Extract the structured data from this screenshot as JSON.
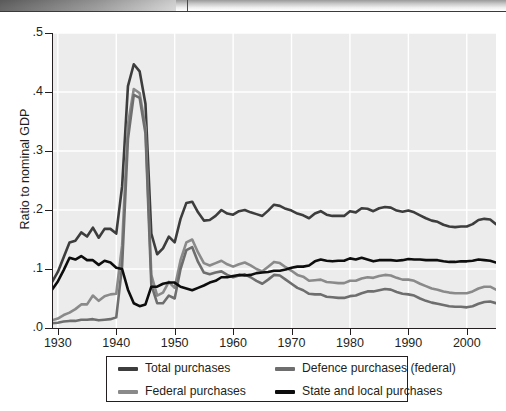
{
  "chart_data": {
    "type": "line",
    "title": "",
    "xlabel": "",
    "ylabel": "Ratio to nominal GDP",
    "xlim": [
      1929,
      2005
    ],
    "ylim": [
      0.0,
      0.5
    ],
    "grid": true,
    "legend_position": "bottom",
    "ytick_labels": [
      ".0",
      ".1",
      ".2",
      ".3",
      ".4",
      ".5"
    ],
    "ytick_values": [
      0.0,
      0.1,
      0.2,
      0.3,
      0.4,
      0.5
    ],
    "xtick_labels": [
      "1930",
      "1940",
      "1950",
      "1960",
      "1970",
      "1980",
      "1990",
      "2000"
    ],
    "xtick_values": [
      1930,
      1940,
      1950,
      1960,
      1970,
      1980,
      1990,
      2000
    ],
    "x": [
      1929,
      1930,
      1931,
      1932,
      1933,
      1934,
      1935,
      1936,
      1937,
      1938,
      1939,
      1940,
      1941,
      1942,
      1943,
      1944,
      1945,
      1946,
      1947,
      1948,
      1949,
      1950,
      1951,
      1952,
      1953,
      1954,
      1955,
      1956,
      1957,
      1958,
      1959,
      1960,
      1961,
      1962,
      1963,
      1964,
      1965,
      1966,
      1967,
      1968,
      1969,
      1970,
      1971,
      1972,
      1973,
      1974,
      1975,
      1976,
      1977,
      1978,
      1979,
      1980,
      1981,
      1982,
      1983,
      1984,
      1985,
      1986,
      1987,
      1988,
      1989,
      1990,
      1991,
      1992,
      1993,
      1994,
      1995,
      1996,
      1997,
      1998,
      1999,
      2000,
      2001,
      2002,
      2003,
      2004,
      2005
    ],
    "series": [
      {
        "name": "Total purchases",
        "color": "#3d3d3d",
        "values": [
          0.078,
          0.095,
          0.12,
          0.145,
          0.148,
          0.162,
          0.155,
          0.17,
          0.153,
          0.168,
          0.168,
          0.16,
          0.24,
          0.41,
          0.447,
          0.435,
          0.38,
          0.16,
          0.125,
          0.135,
          0.155,
          0.145,
          0.185,
          0.212,
          0.214,
          0.196,
          0.182,
          0.183,
          0.19,
          0.2,
          0.194,
          0.192,
          0.198,
          0.2,
          0.196,
          0.193,
          0.19,
          0.199,
          0.209,
          0.207,
          0.202,
          0.199,
          0.194,
          0.191,
          0.186,
          0.194,
          0.198,
          0.192,
          0.19,
          0.19,
          0.19,
          0.198,
          0.196,
          0.203,
          0.202,
          0.198,
          0.203,
          0.205,
          0.204,
          0.199,
          0.197,
          0.199,
          0.196,
          0.191,
          0.186,
          0.182,
          0.18,
          0.175,
          0.172,
          0.171,
          0.172,
          0.172,
          0.176,
          0.183,
          0.185,
          0.184,
          0.176
        ]
      },
      {
        "name": "Federal purchases",
        "color": "#8a8a8a",
        "values": [
          0.013,
          0.016,
          0.022,
          0.026,
          0.032,
          0.04,
          0.04,
          0.055,
          0.046,
          0.054,
          0.057,
          0.058,
          0.14,
          0.345,
          0.405,
          0.398,
          0.34,
          0.09,
          0.055,
          0.06,
          0.078,
          0.068,
          0.115,
          0.145,
          0.15,
          0.128,
          0.11,
          0.106,
          0.11,
          0.114,
          0.108,
          0.104,
          0.108,
          0.111,
          0.106,
          0.1,
          0.096,
          0.104,
          0.112,
          0.11,
          0.103,
          0.097,
          0.09,
          0.087,
          0.08,
          0.081,
          0.082,
          0.078,
          0.077,
          0.076,
          0.076,
          0.08,
          0.08,
          0.084,
          0.086,
          0.085,
          0.088,
          0.09,
          0.089,
          0.085,
          0.082,
          0.082,
          0.08,
          0.075,
          0.071,
          0.067,
          0.065,
          0.062,
          0.06,
          0.059,
          0.059,
          0.059,
          0.062,
          0.067,
          0.07,
          0.07,
          0.065
        ]
      },
      {
        "name": "Defence purchases (federal)",
        "color": "#6e6e6e",
        "values": [
          0.008,
          0.009,
          0.011,
          0.012,
          0.012,
          0.014,
          0.014,
          0.015,
          0.013,
          0.014,
          0.015,
          0.018,
          0.105,
          0.32,
          0.395,
          0.39,
          0.33,
          0.073,
          0.042,
          0.042,
          0.055,
          0.05,
          0.1,
          0.132,
          0.137,
          0.112,
          0.094,
          0.091,
          0.094,
          0.096,
          0.09,
          0.086,
          0.089,
          0.091,
          0.086,
          0.08,
          0.075,
          0.082,
          0.09,
          0.089,
          0.082,
          0.075,
          0.068,
          0.064,
          0.058,
          0.057,
          0.057,
          0.053,
          0.052,
          0.051,
          0.051,
          0.054,
          0.055,
          0.059,
          0.062,
          0.062,
          0.064,
          0.066,
          0.065,
          0.061,
          0.058,
          0.057,
          0.055,
          0.05,
          0.046,
          0.043,
          0.041,
          0.039,
          0.037,
          0.036,
          0.036,
          0.035,
          0.037,
          0.041,
          0.044,
          0.045,
          0.042
        ]
      },
      {
        "name": "State and local purchases",
        "color": "#0d0d0d",
        "values": [
          0.065,
          0.079,
          0.098,
          0.119,
          0.116,
          0.122,
          0.115,
          0.115,
          0.107,
          0.114,
          0.111,
          0.102,
          0.1,
          0.065,
          0.042,
          0.037,
          0.04,
          0.07,
          0.07,
          0.075,
          0.077,
          0.077,
          0.07,
          0.067,
          0.064,
          0.068,
          0.072,
          0.077,
          0.08,
          0.086,
          0.086,
          0.088,
          0.09,
          0.089,
          0.09,
          0.093,
          0.094,
          0.095,
          0.097,
          0.097,
          0.099,
          0.102,
          0.104,
          0.104,
          0.106,
          0.113,
          0.116,
          0.114,
          0.113,
          0.114,
          0.114,
          0.118,
          0.116,
          0.119,
          0.116,
          0.113,
          0.115,
          0.115,
          0.115,
          0.114,
          0.115,
          0.117,
          0.116,
          0.116,
          0.115,
          0.115,
          0.115,
          0.113,
          0.112,
          0.112,
          0.113,
          0.113,
          0.114,
          0.116,
          0.115,
          0.114,
          0.111
        ]
      }
    ]
  },
  "legend": {
    "items": [
      {
        "label": "Total purchases",
        "color": "#3d3d3d"
      },
      {
        "label": "Defence purchases (federal)",
        "color": "#6e6e6e"
      },
      {
        "label": "Federal purchases",
        "color": "#8a8a8a"
      },
      {
        "label": "State and local purchases",
        "color": "#0d0d0d"
      }
    ]
  }
}
